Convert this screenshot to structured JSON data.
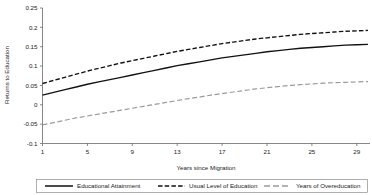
{
  "chart_data": {
    "type": "line",
    "title": "",
    "xlabel": "Years since Migration",
    "ylabel": "Returns to Education",
    "xlim": [
      1,
      30
    ],
    "ylim": [
      -0.1,
      0.25
    ],
    "xticks": [
      "1",
      "5",
      "9",
      "13",
      "17",
      "21",
      "25",
      "29"
    ],
    "xtick_values": [
      1,
      5,
      9,
      13,
      17,
      21,
      25,
      29
    ],
    "yticks": [
      "0.25",
      "0.2",
      "0.15",
      "0.1",
      "0.05",
      "0",
      "-0.05",
      "-0.1"
    ],
    "ytick_values": [
      0.25,
      0.2,
      0.15,
      0.1,
      0.05,
      0,
      -0.05,
      -0.1
    ],
    "grid": false,
    "legend_position": "bottom",
    "x": [
      1,
      2,
      3,
      4,
      5,
      6,
      7,
      8,
      9,
      10,
      11,
      12,
      13,
      14,
      15,
      16,
      17,
      18,
      19,
      20,
      21,
      22,
      23,
      24,
      25,
      26,
      27,
      28,
      29,
      30
    ],
    "series": [
      {
        "name": "Educational Attainment",
        "style": "solid",
        "color": "#111111",
        "values": [
          0.025,
          0.032,
          0.039,
          0.046,
          0.053,
          0.059,
          0.065,
          0.071,
          0.077,
          0.083,
          0.089,
          0.095,
          0.101,
          0.106,
          0.111,
          0.116,
          0.121,
          0.125,
          0.129,
          0.133,
          0.137,
          0.14,
          0.143,
          0.146,
          0.148,
          0.15,
          0.152,
          0.154,
          0.155,
          0.156
        ]
      },
      {
        "name": "Usual Level of Education",
        "style": "dashed",
        "color": "#111111",
        "values": [
          0.055,
          0.063,
          0.071,
          0.079,
          0.087,
          0.094,
          0.101,
          0.108,
          0.114,
          0.12,
          0.126,
          0.132,
          0.138,
          0.143,
          0.148,
          0.153,
          0.158,
          0.162,
          0.166,
          0.17,
          0.173,
          0.176,
          0.179,
          0.182,
          0.184,
          0.186,
          0.188,
          0.19,
          0.191,
          0.192
        ]
      },
      {
        "name": "Years of Overeducation",
        "style": "dashed-gray",
        "color": "#9a9a9a",
        "values": [
          -0.052,
          -0.046,
          -0.04,
          -0.034,
          -0.029,
          -0.024,
          -0.019,
          -0.014,
          -0.009,
          -0.004,
          0.001,
          0.006,
          0.011,
          0.016,
          0.02,
          0.025,
          0.029,
          0.033,
          0.037,
          0.041,
          0.044,
          0.047,
          0.05,
          0.052,
          0.054,
          0.056,
          0.057,
          0.058,
          0.059,
          0.06
        ]
      }
    ]
  },
  "legend": {
    "items": [
      {
        "label": "Educational Attainment"
      },
      {
        "label": "Usual Level of Education"
      },
      {
        "label": "Years of Overeducation"
      }
    ]
  }
}
